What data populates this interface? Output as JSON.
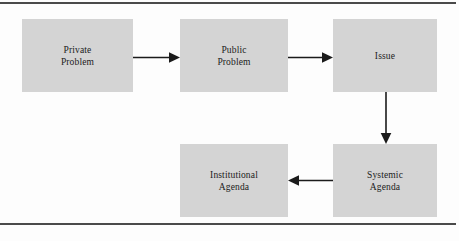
{
  "diagram": {
    "background_color": "#fdfdfd",
    "box_fill_color": "#d4d4d4",
    "line_color": "#1b1b1b",
    "rule_color": "#4a4a4a",
    "nodes": [
      {
        "id": "private-problem",
        "label": "Private\nProblem"
      },
      {
        "id": "public-problem",
        "label": "Public\nProblem"
      },
      {
        "id": "issue",
        "label": "Issue"
      },
      {
        "id": "institutional-agenda",
        "label": "Institutional\nAgenda"
      },
      {
        "id": "systemic-agenda",
        "label": "Systemic\nAgenda"
      }
    ],
    "edges": [
      {
        "id": "private-to-public",
        "from": "private-problem",
        "to": "public-problem",
        "direction": "right"
      },
      {
        "id": "public-to-issue",
        "from": "public-problem",
        "to": "issue",
        "direction": "right"
      },
      {
        "id": "issue-to-systemic",
        "from": "issue",
        "to": "systemic-agenda",
        "direction": "down"
      },
      {
        "id": "systemic-to-institutional",
        "from": "systemic-agenda",
        "to": "institutional-agenda",
        "direction": "left"
      }
    ],
    "rules": {
      "top": "horizontal-rule-top",
      "bottom": "horizontal-rule-bottom"
    }
  }
}
